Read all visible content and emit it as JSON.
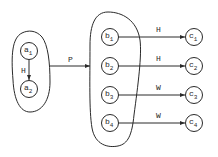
{
  "diagram": {
    "set_a": {
      "nodes": [
        {
          "base": "a",
          "sub": "1",
          "cx": 29,
          "cy": 51
        },
        {
          "base": "a",
          "sub": "2",
          "cx": 29,
          "cy": 89
        }
      ],
      "edge": {
        "label": "H",
        "from": "a1",
        "to": "a2"
      }
    },
    "set_b": {
      "nodes": [
        {
          "base": "b",
          "sub": "1",
          "cx": 110,
          "cy": 37
        },
        {
          "base": "b",
          "sub": "2",
          "cx": 110,
          "cy": 66
        },
        {
          "base": "b",
          "sub": "3",
          "cx": 110,
          "cy": 95
        },
        {
          "base": "b",
          "sub": "4",
          "cx": 110,
          "cy": 123
        }
      ]
    },
    "set_c": {
      "nodes": [
        {
          "base": "c",
          "sub": "1",
          "cx": 194,
          "cy": 37
        },
        {
          "base": "c",
          "sub": "2",
          "cx": 194,
          "cy": 66
        },
        {
          "base": "c",
          "sub": "3",
          "cx": 194,
          "cy": 95
        },
        {
          "base": "c",
          "sub": "4",
          "cx": 194,
          "cy": 123
        }
      ]
    },
    "mapping": {
      "label": "P",
      "from": "set_a",
      "to": "set_b"
    },
    "edges": [
      {
        "label": "H",
        "from": "b1",
        "to": "c1"
      },
      {
        "label": "H",
        "from": "b2",
        "to": "c2"
      },
      {
        "label": "W",
        "from": "b3",
        "to": "c3"
      },
      {
        "label": "W",
        "from": "b4",
        "to": "c4"
      }
    ],
    "colors": {
      "stroke": "#2a2a2a",
      "background": "#ffffff"
    }
  }
}
